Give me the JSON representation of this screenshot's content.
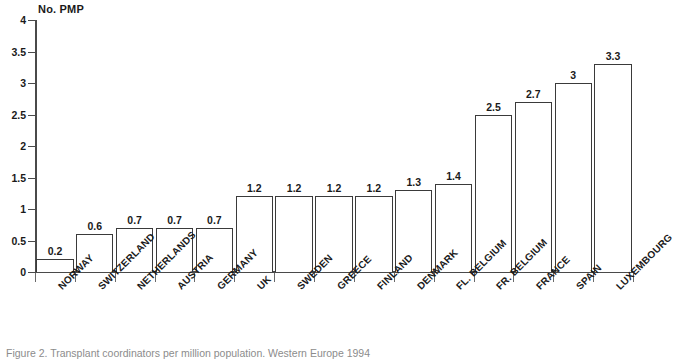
{
  "chart_data": {
    "type": "bar",
    "title": "",
    "ylabel": "No. PMP",
    "xlabel": "",
    "ylim": [
      0,
      4
    ],
    "yticks": [
      "0",
      "0.5",
      "1",
      "1.5",
      "2",
      "2.5",
      "3",
      "3.5",
      "4"
    ],
    "ytick_values": [
      0,
      0.5,
      1,
      1.5,
      2,
      2.5,
      3,
      3.5,
      4
    ],
    "grid": false,
    "legend": null,
    "categories": [
      "NORWAY",
      "SWITZERLAND",
      "NETHERLANDS",
      "AUSTRIA",
      "GERMANY",
      "UK",
      "SWEDEN",
      "GREECE",
      "FINLAND",
      "DENMARK",
      "FL. BELGIUM",
      "FR. BELGIUM",
      "FRANCE",
      "SPAIN",
      "LUXEMBOURG"
    ],
    "values": [
      0.2,
      0.6,
      0.7,
      0.7,
      0.7,
      1.2,
      1.2,
      1.2,
      1.2,
      1.3,
      1.4,
      2.5,
      2.7,
      3,
      3.3
    ],
    "value_labels": [
      "0.2",
      "0.6",
      "0.7",
      "0.7",
      "0.7",
      "1.2",
      "1.2",
      "1.2",
      "1.2",
      "1.3",
      "1.4",
      "2.5",
      "2.7",
      "3",
      "3.3"
    ],
    "bar_fill": "#ffffff",
    "bar_edge": "#3a3a3a",
    "axis_color": "#4a4a4a"
  },
  "caption": {
    "text": "Figure 2. Transplant coordinators per million population. Western Europe 1994"
  }
}
